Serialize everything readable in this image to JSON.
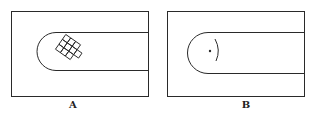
{
  "panels": [
    {
      "id": "A",
      "label": "A",
      "description": "Rectangular frame with U-shaped channel containing a tilted grid of squares"
    },
    {
      "id": "B",
      "label": "B",
      "description": "Rectangular frame with U-shaped channel containing a dot and a curved arc"
    }
  ],
  "colors": {
    "stroke": "#2a2a2a",
    "background": "#ffffff"
  }
}
